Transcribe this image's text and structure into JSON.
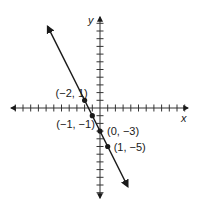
{
  "chart_data": {
    "type": "line",
    "title": "",
    "xlabel": "x",
    "ylabel": "y",
    "equation": "y = -2x - 3",
    "xlim": [
      -11,
      11
    ],
    "ylim": [
      -12,
      11
    ],
    "grid": false,
    "points": [
      {
        "x": -2,
        "y": 1,
        "label": "(−2, 1)"
      },
      {
        "x": -1,
        "y": -1,
        "label": "(−1, −1)"
      },
      {
        "x": 0,
        "y": -3,
        "label": "(0, −3)"
      },
      {
        "x": 1,
        "y": -5,
        "label": "(1, −5)"
      }
    ],
    "line_color": "#1a1a1a",
    "axis_color": "#333333"
  },
  "axes": {
    "x_label": "x",
    "y_label": "y"
  }
}
